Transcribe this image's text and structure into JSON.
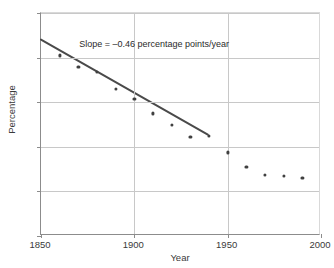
{
  "chart_data": {
    "type": "scatter",
    "title": "",
    "xlabel": "Year",
    "ylabel": "Percentage",
    "xlim": [
      1850,
      2000
    ],
    "ylim": [
      0,
      100
    ],
    "xticks": [
      1850,
      1900,
      1950,
      2000
    ],
    "yticks": [
      0,
      20,
      40,
      60,
      80,
      100
    ],
    "xtick_labels": [
      "1850",
      "1900",
      "1950",
      "2000"
    ],
    "ytick_labels": [
      "0",
      "20",
      "40",
      "60",
      "80",
      "100"
    ],
    "grid": true,
    "grid_axes": "both",
    "legend": false,
    "series": [
      {
        "name": "Percentage",
        "marker": "circle",
        "color": "#404040",
        "x": [
          1860,
          1870,
          1880,
          1890,
          1900,
          1910,
          1920,
          1930,
          1940,
          1950,
          1960,
          1970,
          1980,
          1990
        ],
        "values": [
          81,
          76,
          73.5,
          66,
          61.5,
          55,
          50,
          44.5,
          45,
          37.5,
          31,
          27.5,
          27,
          26
        ]
      }
    ],
    "trendline": {
      "name": "fitted-trend-line",
      "color": "#4a4a4a",
      "x_start": 1850,
      "y_start": 88,
      "x_end": 1940,
      "y_end": 45,
      "slope": -0.46,
      "slope_units": "percentage points/year"
    },
    "annotations": [
      {
        "name": "slope-annotation",
        "text": "Slope = –0.46 percentage points/year",
        "x": 1871,
        "y": 85
      }
    ]
  }
}
